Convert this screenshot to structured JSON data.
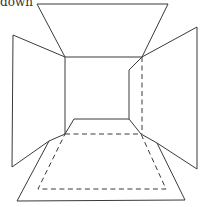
{
  "caption": "down",
  "diagram": {
    "colors": {
      "line": "#3a3a3a",
      "background": "#ffffff"
    },
    "panels": [
      "ceiling",
      "left-wall",
      "right-wall",
      "floor",
      "back-wall"
    ]
  }
}
